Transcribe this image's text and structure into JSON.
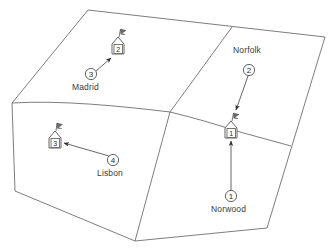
{
  "figure": {
    "type": "network-topology-map",
    "background_color": "#ffffff",
    "line_color": "#6e6e6e",
    "text_color": "#3a3a3a"
  },
  "regions": {
    "outline_name": "map-outline",
    "divider_names": [
      "region-divider-upper",
      "region-divider-center",
      "region-divider-right"
    ]
  },
  "sites": [
    {
      "id": "site-2",
      "icon": "tower-flag-icon",
      "box_label": "2",
      "name": "Madrid",
      "callout": "3",
      "x": 118,
      "y": 44,
      "label_x": 72,
      "label_y": 86,
      "callout_x": 91,
      "callout_y": 74
    },
    {
      "id": "site-1",
      "icon": "tower-flag-icon",
      "box_label": "1",
      "name": "Norfolk",
      "callout": "2",
      "x": 231,
      "y": 128,
      "label_x": 233,
      "label_y": 50,
      "callout_x": 249,
      "callout_y": 70
    },
    {
      "id": "site-3",
      "icon": "tower-flag-icon",
      "box_label": "3",
      "name": "Lisbon",
      "callout": "4",
      "x": 55,
      "y": 138,
      "label_x": 96,
      "label_y": 172,
      "callout_x": 113,
      "callout_y": 160
    },
    {
      "id": "site-norwood",
      "icon": "none",
      "box_label": "",
      "name": "Norwood",
      "callout": "1",
      "x": 231,
      "y": 128,
      "label_x": 212,
      "label_y": 208,
      "callout_x": 231,
      "callout_y": 196
    }
  ],
  "labels": {
    "madrid": "Madrid",
    "norfolk": "Norfolk",
    "lisbon": "Lisbon",
    "norwood": "Norwood"
  },
  "callouts": {
    "madrid": "3",
    "norfolk": "2",
    "lisbon": "4",
    "norwood": "1"
  },
  "boxes": {
    "madrid": "2",
    "norfolk": "1",
    "lisbon": "3"
  }
}
